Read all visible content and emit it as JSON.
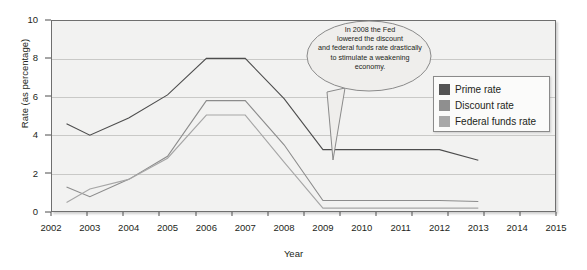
{
  "chart_data": {
    "type": "line",
    "title": "",
    "xlabel": "Year",
    "ylabel": "Rate (as percentage)",
    "xlim": [
      2002,
      2015
    ],
    "ylim": [
      0,
      10
    ],
    "xticks": [
      "2002",
      "2003",
      "2004",
      "2005",
      "2006",
      "2007",
      "2008",
      "2009",
      "2010",
      "2011",
      "2012",
      "2013",
      "2014",
      "2015"
    ],
    "yticks": [
      "0",
      "2",
      "4",
      "6",
      "8",
      "10"
    ],
    "grid": true,
    "legend_position": "right-upper-inside",
    "x": [
      2002.4,
      2003,
      2004,
      2005,
      2006,
      2007,
      2008,
      2009,
      2010,
      2011,
      2012,
      2013
    ],
    "series": [
      {
        "name": "Prime rate",
        "color": "#4d4d4d",
        "values": [
          4.6,
          4.0,
          4.9,
          6.1,
          8.0,
          8.0,
          5.9,
          3.25,
          3.25,
          3.25,
          3.25,
          2.7
        ]
      },
      {
        "name": "Discount rate",
        "color": "#8c8c8c",
        "values": [
          1.3,
          0.8,
          1.7,
          2.9,
          5.8,
          5.8,
          3.5,
          0.6,
          0.6,
          0.6,
          0.6,
          0.55
        ]
      },
      {
        "name": "Federal funds rate",
        "color": "#a6a6a6",
        "values": [
          0.5,
          1.2,
          1.7,
          2.8,
          5.05,
          5.05,
          2.6,
          0.2,
          0.2,
          0.2,
          0.2,
          0.2
        ]
      }
    ],
    "annotations": [
      {
        "name": "fed-rate-callout",
        "lines": [
          "In 2008 the Fed",
          "lowered the discount",
          "and federal funds rate drastically",
          "to stimulate a weakening",
          "economy."
        ],
        "points_to_year": 2008
      }
    ]
  },
  "legend": {
    "items": [
      {
        "label": "Prime rate",
        "color": "#545454"
      },
      {
        "label": "Discount rate",
        "color": "#8f8f8f"
      },
      {
        "label": "Federal funds rate",
        "color": "#a8a8a8"
      }
    ]
  }
}
